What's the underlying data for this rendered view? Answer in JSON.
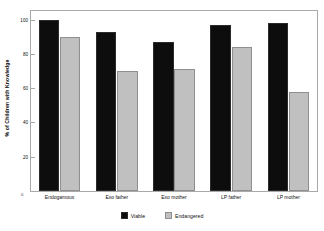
{
  "chart_data": {
    "type": "bar",
    "title": "",
    "xlabel": "",
    "ylabel": "% of Children with Knowledge",
    "ylim": [
      0,
      105
    ],
    "yticks": [
      20,
      40,
      60,
      80,
      100
    ],
    "ytick_labels": [
      "20",
      "40",
      "60",
      "80",
      "100"
    ],
    "grid": false,
    "legend_position": "bottom-center",
    "origin_label": "0",
    "categories": [
      "Endogamous",
      "Exo father",
      "Exo mother",
      "LP father",
      "LP mother"
    ],
    "series": [
      {
        "name": "Viable",
        "color": "#0d0d0d",
        "values": [
          100,
          93,
          87,
          97,
          98
        ]
      },
      {
        "name": "Endangered",
        "color": "#c0c0c0",
        "values": [
          90,
          70,
          71,
          84,
          58
        ]
      }
    ]
  },
  "legend": {
    "entries": [
      {
        "label": "Viable",
        "color": "#0d0d0d"
      },
      {
        "label": "Endangered",
        "color": "#c0c0c0"
      }
    ]
  }
}
